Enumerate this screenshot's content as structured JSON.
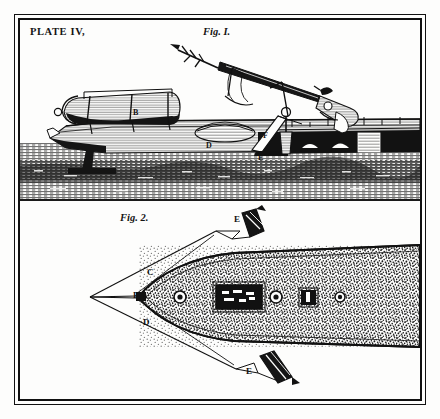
{
  "plate": {
    "title": "PLATE IV,",
    "paper_color": "#fdfdfc",
    "ink_color": "#141414",
    "border_style": "double-rule"
  },
  "figures": [
    {
      "id": "fig1",
      "caption": "Fig. I.",
      "view": "side elevation",
      "subject": "whaling boat with mounted harpoon gun and cylindrical torpedo float",
      "labels": [
        {
          "text": "B",
          "x": 113,
          "y": 113,
          "note": "cylindrical torpedo float body"
        },
        {
          "text": "D",
          "x": 188,
          "y": 127,
          "note": "deck housing"
        },
        {
          "text": "F",
          "x": 245,
          "y": 119,
          "note": "gun carriage"
        },
        {
          "text": "E",
          "x": 240,
          "y": 139,
          "note": "launch rail"
        }
      ]
    },
    {
      "id": "fig2",
      "caption": "Fig. 2.",
      "view": "plan view from above",
      "subject": "boat hull in plan with port and starboard harpoon lines deployed",
      "labels": [
        {
          "text": "C",
          "x": 128,
          "y": 73,
          "note": "upper guide line"
        },
        {
          "text": "B",
          "x": 114,
          "y": 96,
          "note": "bow point / centre line"
        },
        {
          "text": "D",
          "x": 124,
          "y": 123,
          "note": "lower guide line"
        },
        {
          "text": "E",
          "x": 232,
          "y": 20,
          "note": "upper harpoon head"
        },
        {
          "text": "E",
          "x": 248,
          "y": 169,
          "note": "lower harpoon head"
        }
      ]
    }
  ]
}
